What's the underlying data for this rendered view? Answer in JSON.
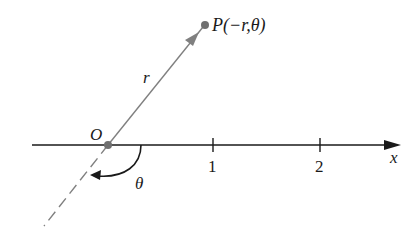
{
  "diagram": {
    "type": "polar-coordinate-illustration",
    "point_label": "P(−r,θ)",
    "origin_label": "O",
    "ray_label": "r",
    "angle_label": "θ",
    "axis_label": "x",
    "ticks": [
      {
        "value": 1,
        "label": "1"
      },
      {
        "value": 2,
        "label": "2"
      }
    ],
    "colors": {
      "axis": "#1a1a1a",
      "ray": "#808080",
      "point": "#707070",
      "text": "#1a1a1a"
    }
  }
}
